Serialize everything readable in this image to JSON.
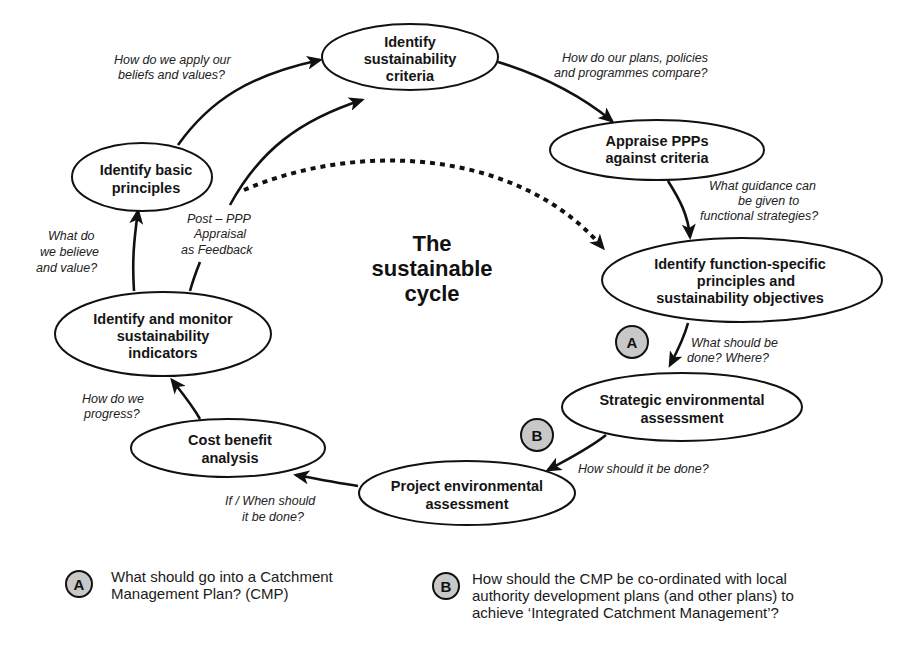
{
  "title": {
    "lines": [
      "The",
      "sustainable",
      "cycle"
    ]
  },
  "nodes": [
    {
      "id": "identify-sustainability-criteria",
      "lines": [
        "Identify",
        "sustainability",
        "criteria"
      ]
    },
    {
      "id": "appraise-ppps",
      "lines": [
        "Appraise PPPs",
        "against criteria"
      ]
    },
    {
      "id": "identify-function-specific",
      "lines": [
        "Identify function-specific",
        "principles and",
        "sustainability objectives"
      ]
    },
    {
      "id": "strategic-environmental-assessment",
      "lines": [
        "Strategic environmental",
        "assessment"
      ]
    },
    {
      "id": "project-environmental-assessment",
      "lines": [
        "Project environmental",
        "assessment"
      ]
    },
    {
      "id": "cost-benefit-analysis",
      "lines": [
        "Cost benefit",
        "analysis"
      ]
    },
    {
      "id": "identify-monitor-indicators",
      "lines": [
        "Identify and monitor",
        "sustainability",
        "indicators"
      ]
    },
    {
      "id": "identify-basic-principles",
      "lines": [
        "Identify basic",
        "principles"
      ]
    }
  ],
  "questions": [
    {
      "id": "apply-beliefs",
      "lines": [
        "How do we apply our",
        "beliefs and values?"
      ]
    },
    {
      "id": "plans-compare",
      "lines": [
        "How do our plans, policies",
        "and programmes compare?"
      ]
    },
    {
      "id": "guidance",
      "lines": [
        "What guidance can",
        "be given to",
        "functional strategies?"
      ]
    },
    {
      "id": "what-where",
      "lines": [
        "What should be",
        "done? Where?"
      ]
    },
    {
      "id": "how-done",
      "lines": [
        "How should it be done?"
      ]
    },
    {
      "id": "if-when",
      "lines": [
        "If / When should",
        "it be done?"
      ]
    },
    {
      "id": "progress",
      "lines": [
        "How do we",
        "progress?"
      ]
    },
    {
      "id": "believe-value",
      "lines": [
        "What do",
        "we believe",
        "and value?"
      ]
    },
    {
      "id": "feedback",
      "lines": [
        "Post – PPP",
        "Appraisal",
        "as Feedback"
      ]
    }
  ],
  "badges": {
    "a": "A",
    "b": "B"
  },
  "legend": [
    {
      "badge": "A",
      "lines": [
        "What should go into a Catchment",
        "Management Plan? (CMP)"
      ]
    },
    {
      "badge": "B",
      "lines": [
        "How should the CMP be co-ordinated with local",
        "authority development plans (and other plans) to",
        "achieve ‘Integrated Catchment Management’?"
      ]
    }
  ],
  "colors": {
    "stroke": "#111111",
    "badge_fill": "#c8c8c8",
    "background": "#ffffff"
  }
}
